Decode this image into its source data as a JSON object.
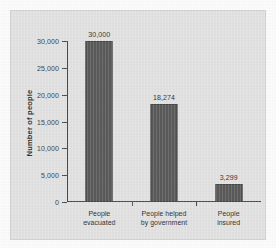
{
  "chart_data": {
    "type": "bar",
    "title": "",
    "xlabel": "",
    "ylabel": "Number of people",
    "categories": [
      "People evacuated",
      "People helped by government",
      "People insured"
    ],
    "category_lines": [
      [
        "People",
        "evacuated"
      ],
      [
        "People helped",
        "by government"
      ],
      [
        "People",
        "insured"
      ]
    ],
    "values": [
      30000,
      18274,
      3299
    ],
    "value_labels": [
      "30,000",
      "18,274",
      "3,299"
    ],
    "ylim": [
      0,
      30000
    ],
    "yticks": [
      0,
      5000,
      10000,
      15000,
      20000,
      25000,
      30000
    ],
    "ytick_labels": [
      "0",
      "5,000",
      "10,000",
      "15,000",
      "20,000",
      "25,000",
      "30,000"
    ],
    "grid": false,
    "legend": "none",
    "bar_color": "#5a5a5a",
    "bar_edge_color": "#464646",
    "axis_color": "#4a4a4a",
    "panel_color": "#e2e2e2",
    "background_color": "#fcfcfc"
  }
}
